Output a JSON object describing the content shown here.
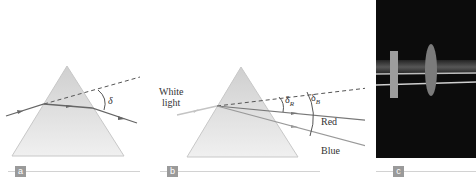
{
  "figure": {
    "panels": [
      {
        "id": "a",
        "label": "a",
        "angle_symbol": "δ",
        "description": "Light ray refracted through a prism, deviation angle δ"
      },
      {
        "id": "b",
        "label": "b",
        "incoming_label_line1": "White",
        "incoming_label_line2": "light",
        "angle_red_symbol": "δ",
        "angle_red_sub": "R",
        "angle_blue_symbol": "δ",
        "angle_blue_sub": "B",
        "ray_red_label": "Red",
        "ray_blue_label": "Blue",
        "description": "Dispersion of white light into red and blue"
      },
      {
        "id": "c",
        "label": "c",
        "description": "Photograph of light beams passing through a lens and a block"
      }
    ],
    "colors": {
      "prism_fill": "#dcdcdc",
      "ray": "#666666",
      "incoming_white": "#c4c4c4",
      "label_box": "#9a9a9a",
      "rule": "#d2d2d2",
      "photo_bg": "#0c0c0c"
    }
  }
}
